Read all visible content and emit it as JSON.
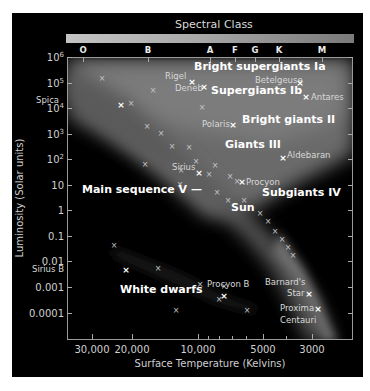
{
  "title": "Spectral Class",
  "spectral_classes": [
    {
      "label": "O",
      "x": 83
    },
    {
      "label": "B",
      "x": 148
    },
    {
      "label": "A",
      "x": 210
    },
    {
      "label": "F",
      "x": 235
    },
    {
      "label": "G",
      "x": 255
    },
    {
      "label": "K",
      "x": 279
    },
    {
      "label": "M",
      "x": 322
    }
  ],
  "axes": {
    "y_title": "Luminosity (Solar units)",
    "x_title": "Surface Temperature (Kelvins)",
    "y_ticks": [
      {
        "label": "10",
        "sup": "6",
        "y": 57
      },
      {
        "label": "10",
        "sup": "5",
        "y": 83
      },
      {
        "label": "10",
        "sup": "4",
        "y": 108
      },
      {
        "label": "10",
        "sup": "3",
        "y": 134
      },
      {
        "label": "10",
        "sup": "2",
        "y": 159
      },
      {
        "label": "10",
        "sup": "",
        "y": 185
      },
      {
        "label": "1",
        "sup": "",
        "y": 210
      },
      {
        "label": "0.1",
        "sup": "",
        "y": 236
      },
      {
        "label": "0.01",
        "sup": "",
        "y": 261
      },
      {
        "label": "0.001",
        "sup": "",
        "y": 287
      },
      {
        "label": "0.0001",
        "sup": "",
        "y": 313
      }
    ],
    "x_ticks": [
      {
        "label": "30,000",
        "x": 92
      },
      {
        "label": "20,000",
        "x": 132
      },
      {
        "label": "10,000",
        "x": 198
      },
      {
        "label": "5000",
        "x": 263
      },
      {
        "label": "3000",
        "x": 312
      }
    ],
    "x_minor_ticks": [
      208,
      219,
      232,
      246,
      286
    ]
  },
  "groups": [
    {
      "label": "Bright supergiants Ia",
      "x": 194,
      "y": 67
    },
    {
      "label": "Supergiants Ib",
      "x": 211,
      "y": 91
    },
    {
      "label": "Bright giants II",
      "x": 242,
      "y": 120
    },
    {
      "label": "Giants III",
      "x": 225,
      "y": 145
    },
    {
      "label": "Main sequence V —",
      "x": 82,
      "y": 190
    },
    {
      "label": "Subgiants IV",
      "x": 262,
      "y": 193
    },
    {
      "label": "Sun",
      "x": 231,
      "y": 208
    },
    {
      "label": "White dwarfs",
      "x": 120,
      "y": 290
    }
  ],
  "stars": [
    {
      "name": "Rigel",
      "label_x": 165,
      "label_y": 77,
      "mx": 192,
      "my": 82,
      "bright": true
    },
    {
      "name": "Deneb",
      "label_x": 175,
      "label_y": 89,
      "mx": 204,
      "my": 87,
      "bright": true
    },
    {
      "name": "Betelgeuse",
      "label_x": 255,
      "label_y": 81,
      "mx": 300,
      "my": 83,
      "bright": true
    },
    {
      "name": "Antares",
      "label_x": 311,
      "label_y": 98,
      "mx": 306,
      "my": 97,
      "bright": true
    },
    {
      "name": "Spica",
      "label_x": 36,
      "label_y": 101,
      "mx": 121,
      "my": 105,
      "bright": true
    },
    {
      "name": "Polaris",
      "label_x": 202,
      "label_y": 125,
      "mx": 233,
      "my": 125,
      "bright": true
    },
    {
      "name": "Aldebaran",
      "label_x": 287,
      "label_y": 156,
      "mx": 283,
      "my": 158,
      "bright": true
    },
    {
      "name": "Sirius",
      "label_x": 172,
      "label_y": 168,
      "mx": 199,
      "my": 173,
      "bright": true
    },
    {
      "name": "Procyon",
      "label_x": 246,
      "label_y": 183,
      "mx": 242,
      "my": 182,
      "bright": true
    },
    {
      "name": "Sirius B",
      "label_x": 32,
      "label_y": 270,
      "mx": 126,
      "my": 270,
      "bright": true
    },
    {
      "name": "Procyon B",
      "label_x": 207,
      "label_y": 285,
      "mx": 224,
      "my": 296,
      "bright": true
    },
    {
      "name": "Barnard's",
      "label_x": 265,
      "label_y": 283,
      "mx": 0,
      "my": 0,
      "bright": false
    },
    {
      "name": "Star",
      "label_x": 287,
      "label_y": 294,
      "mx": 309,
      "my": 294,
      "bright": true
    },
    {
      "name": "Proxima",
      "label_x": 280,
      "label_y": 309,
      "mx": 318,
      "my": 309,
      "bright": true
    },
    {
      "name": "Centauri",
      "label_x": 280,
      "label_y": 321,
      "mx": 0,
      "my": 0,
      "bright": false
    }
  ],
  "minor_markers": [
    [
      102,
      79
    ],
    [
      153,
      91
    ],
    [
      131,
      104
    ],
    [
      147,
      127
    ],
    [
      161,
      134
    ],
    [
      172,
      147
    ],
    [
      189,
      148
    ],
    [
      196,
      162
    ],
    [
      181,
      171
    ],
    [
      215,
      166
    ],
    [
      209,
      175
    ],
    [
      230,
      177
    ],
    [
      217,
      193
    ],
    [
      228,
      201
    ],
    [
      244,
      201
    ],
    [
      260,
      214
    ],
    [
      268,
      222
    ],
    [
      275,
      232
    ],
    [
      282,
      240
    ],
    [
      288,
      248
    ],
    [
      293,
      256
    ],
    [
      114,
      246
    ],
    [
      158,
      269
    ],
    [
      200,
      285
    ],
    [
      219,
      300
    ],
    [
      247,
      311
    ],
    [
      176,
      311
    ],
    [
      224,
      287
    ],
    [
      237,
      182
    ],
    [
      202,
      108
    ],
    [
      145,
      165
    ],
    [
      180,
      185
    ]
  ]
}
